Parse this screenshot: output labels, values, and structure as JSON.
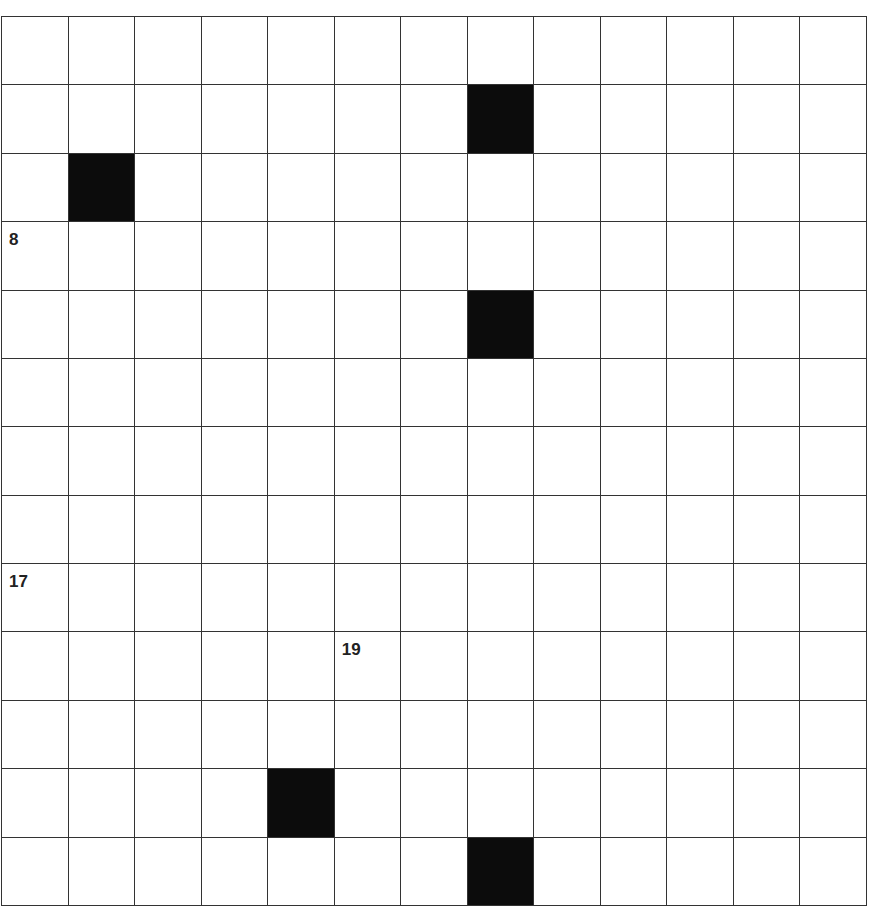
{
  "puzzle": {
    "rows": 13,
    "cols": 13,
    "black_cells": [
      [
        1,
        7
      ],
      [
        2,
        1
      ],
      [
        4,
        7
      ],
      [
        11,
        4
      ],
      [
        12,
        7
      ]
    ],
    "numbers": [
      {
        "row": 3,
        "col": 0,
        "label": "8"
      },
      {
        "row": 8,
        "col": 0,
        "label": "17"
      },
      {
        "row": 9,
        "col": 5,
        "label": "19"
      }
    ]
  }
}
